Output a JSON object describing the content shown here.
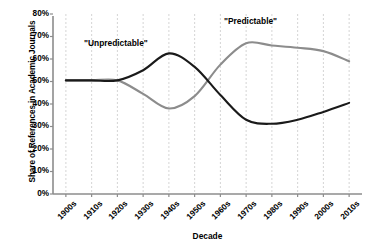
{
  "chart_data": {
    "type": "line",
    "title": "",
    "xlabel": "Decade",
    "ylabel": "Share of References in Academic Journals",
    "categories": [
      "1900s",
      "1910s",
      "1920s",
      "1930s",
      "1940s",
      "1950s",
      "1960s",
      "1970s",
      "1980s",
      "1990s",
      "2000s",
      "2010s"
    ],
    "ylim": [
      0,
      80
    ],
    "ytick_labels": [
      "0%",
      "10%",
      "20%",
      "30%",
      "40%",
      "50%",
      "60%",
      "70%",
      "80%"
    ],
    "ytick_values": [
      0,
      10,
      20,
      30,
      40,
      50,
      60,
      70,
      80
    ],
    "grid": "vertical-dashed",
    "legend": "inline-annotations",
    "series": [
      {
        "name": "\"Unpredictable\"",
        "color": "#1a1a1a",
        "annotation": "\"Unpredictable\"",
        "values": [
          50.5,
          50.5,
          50.5,
          55.0,
          62.5,
          56.5,
          44.0,
          33.0,
          31.2,
          33.0,
          36.5,
          40.5
        ]
      },
      {
        "name": "\"Predictable\"",
        "color": "#8c8c8c",
        "annotation": "\"Predictable\"",
        "values": [
          50.5,
          50.5,
          50.5,
          44.5,
          38.0,
          43.5,
          57.5,
          67.0,
          66.0,
          65.0,
          63.5,
          59.0
        ]
      }
    ]
  },
  "annotations": {
    "unpredictable": "\"Unpredictable\"",
    "predictable": "\"Predictable\""
  },
  "axes": {
    "x_title": "Decade",
    "y_title": "Share of References in Academic Journals"
  },
  "colors": {
    "black_series": "#1a1a1a",
    "gray_series": "#8c8c8c",
    "axis": "#8c8c8c",
    "gridline": "#c9c9c9",
    "background": "#ffffff"
  }
}
